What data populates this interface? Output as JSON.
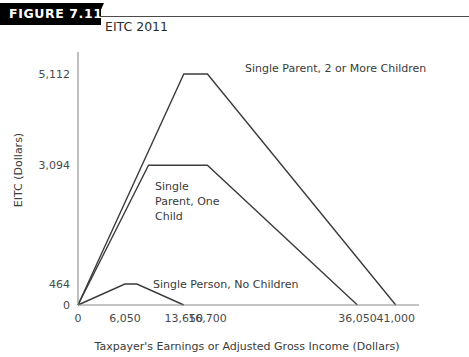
{
  "header": {
    "banner_label": "FIGURE 7.11",
    "title": "EITC 2011"
  },
  "chart_data": {
    "type": "line",
    "title": "EITC 2011",
    "xlabel": "Taxpayer's Earnings or Adjusted Gross Income (Dollars)",
    "ylabel": "EITC (Dollars)",
    "xlim": [
      0,
      44000
    ],
    "ylim": [
      0,
      5600
    ],
    "grid": false,
    "legend": "inline-annotations",
    "xticks": [
      0,
      6050,
      13650,
      16700,
      36050,
      41000
    ],
    "xticklabels": [
      "0",
      "6,050",
      "13,650",
      "16,700",
      "36,050",
      "41,000"
    ],
    "yticks": [
      0,
      464,
      3094,
      5112
    ],
    "yticklabels": [
      "0",
      "464",
      "3,094",
      "5,112"
    ],
    "series": [
      {
        "name": "Single Parent, 2 or More Children",
        "label": "Single Parent, 2 or More Children",
        "x": [
          0,
          13650,
          16700,
          41000
        ],
        "y": [
          0,
          5112,
          5112,
          0
        ]
      },
      {
        "name": "Single Parent, One Child",
        "label": "Single Parent, One Child",
        "label_lines": [
          "Single",
          "Parent, One",
          "Child"
        ],
        "x": [
          0,
          9100,
          16700,
          36050
        ],
        "y": [
          0,
          3094,
          3094,
          0
        ]
      },
      {
        "name": "Single Person, No Children",
        "label": "Single Person, No Children",
        "x": [
          0,
          6050,
          7600,
          13650
        ],
        "y": [
          0,
          464,
          464,
          0
        ]
      }
    ]
  }
}
